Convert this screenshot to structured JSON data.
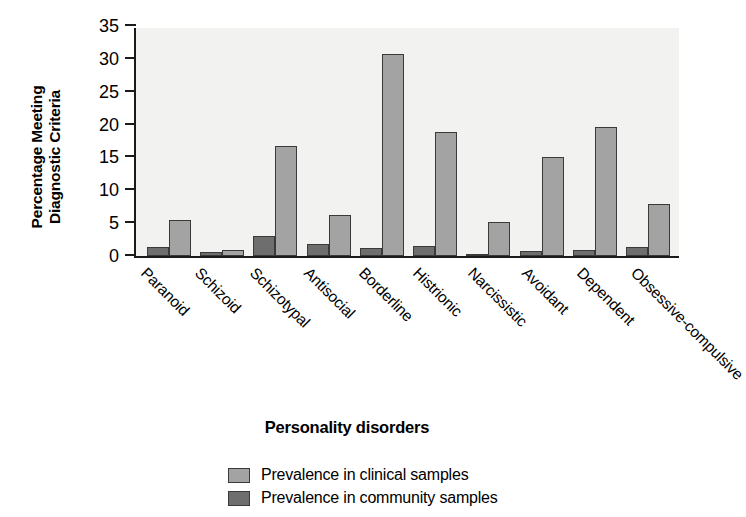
{
  "chart_data": {
    "type": "bar",
    "title": "",
    "xlabel": "Personality disorders",
    "ylabel_line1": "Percentage Meeting",
    "ylabel_line2": "Diagnostic Criteria",
    "ylim": [
      0,
      35
    ],
    "yticks": [
      0,
      5,
      10,
      15,
      20,
      25,
      30,
      35
    ],
    "grid": false,
    "legend_position": "bottom-center",
    "categories": [
      "Paranoid",
      "Schizoid",
      "Schizotypal",
      "Antisocial",
      "Borderline",
      "Histrionic",
      "Narcissistic",
      "Avoidant",
      "Dependent",
      "Obsessive-compulsive"
    ],
    "series": [
      {
        "name": "Prevalence in community samples",
        "color": "#6e6e6e",
        "values": [
          1.3,
          0.6,
          3.0,
          1.8,
          1.2,
          1.6,
          0.2,
          0.8,
          0.9,
          1.4
        ]
      },
      {
        "name": "Prevalence in clinical samples",
        "color": "#a3a3a3",
        "values": [
          5.5,
          0.9,
          16.8,
          6.3,
          30.7,
          18.8,
          5.2,
          15.1,
          19.6,
          7.9
        ]
      }
    ]
  },
  "legend": {
    "items": [
      {
        "label": "Prevalence in clinical samples",
        "swatch": "clinical"
      },
      {
        "label": "Prevalence in community samples",
        "swatch": "community"
      }
    ]
  }
}
